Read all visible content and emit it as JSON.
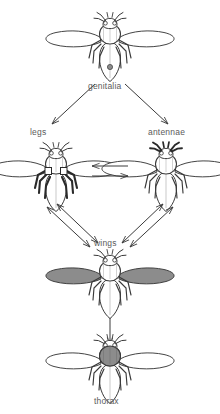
{
  "figure": {
    "background_color": "#ffffff",
    "line_color": "#3a3a3a",
    "label_color": "#5b5b5b",
    "highlight_fill": "#8c8c8c"
  },
  "labels": {
    "genitalia": "genitalia",
    "legs": "legs",
    "antennae": "antennae",
    "wings": "wings",
    "thorax": "thorax"
  },
  "nodes": [
    {
      "id": "top",
      "label": "genitalia",
      "highlight": "genitalia-spot",
      "x": 110,
      "y": 42
    },
    {
      "id": "left",
      "label": "legs",
      "highlight": "legs",
      "x": 56,
      "y": 174
    },
    {
      "id": "right",
      "label": "antennae",
      "highlight": "antennae",
      "x": 166,
      "y": 174
    },
    {
      "id": "wings",
      "label": "wings",
      "highlight": "wings",
      "x": 110,
      "y": 281
    },
    {
      "id": "bottom",
      "label": "thorax",
      "highlight": "thorax",
      "x": 110,
      "y": 364
    }
  ],
  "edges": [
    {
      "from": "top",
      "to": "left",
      "style": "single-arrow"
    },
    {
      "from": "top",
      "to": "right",
      "style": "single-arrow"
    },
    {
      "from": "left",
      "to": "right",
      "style": "double-parallel-arrow"
    },
    {
      "from": "left",
      "to": "wings",
      "style": "double-headed-pair"
    },
    {
      "from": "right",
      "to": "wings",
      "style": "double-headed-pair"
    },
    {
      "from": "wings",
      "to": "bottom",
      "style": "single-arrow"
    }
  ]
}
